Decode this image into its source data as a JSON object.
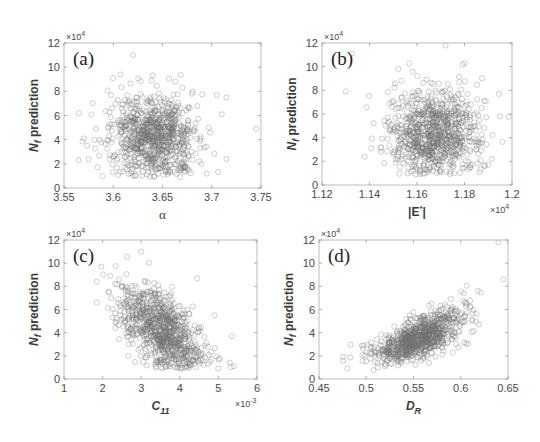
{
  "figure": {
    "panels": [
      "a",
      "b",
      "c",
      "d"
    ]
  },
  "chart_data": [
    {
      "id": "a",
      "type": "scatter",
      "panel_label": "(a)",
      "title": "",
      "xlabel": "α",
      "ylabel": "N_f prediction",
      "ylabel_main": "N",
      "ylabel_sub": "f",
      "ylabel_rest": " prediction",
      "y_multiplier": "×10",
      "y_multiplier_exp": "4",
      "x_multiplier": "",
      "xlim": [
        3.55,
        3.75
      ],
      "ylim": [
        0,
        12
      ],
      "xticks": [
        "3.55",
        "3.6",
        "3.65",
        "3.7",
        "3.75"
      ],
      "yticks": [
        "0",
        "2",
        "4",
        "6",
        "8",
        "10",
        "12"
      ],
      "grid": false,
      "marker": "open-circle",
      "description": "Roughly 1000 points clustered around α≈3.64, N_f≈4×10^4, no clear trend",
      "frame": {
        "left": 64,
        "right": 261,
        "top": 43,
        "bottom": 188
      },
      "points_summary": {
        "x_center": 3.642,
        "x_sd": 0.022,
        "y_center": 4.3,
        "y_sd": 1.7,
        "n": 900,
        "corr": -0.05
      },
      "outliers": [
        [
          3.565,
          6.2
        ],
        [
          3.565,
          2.3
        ],
        [
          3.57,
          4.1
        ],
        [
          3.575,
          2.4
        ],
        [
          3.62,
          11.0
        ],
        [
          3.745,
          4.9
        ],
        [
          3.715,
          2.4
        ],
        [
          3.705,
          7.7
        ],
        [
          3.715,
          7.5
        ]
      ]
    },
    {
      "id": "b",
      "type": "scatter",
      "panel_label": "(b)",
      "title": "",
      "xlabel": "|E*|",
      "ylabel": "N_f prediction",
      "ylabel_main": "N",
      "ylabel_sub": "f",
      "ylabel_rest": " prediction",
      "y_multiplier": "×10",
      "y_multiplier_exp": "4",
      "x_multiplier": "×10",
      "x_multiplier_exp": "4",
      "xlim": [
        1.12,
        1.2
      ],
      "ylim": [
        0,
        12
      ],
      "xticks": [
        "1.12",
        "1.14",
        "1.16",
        "1.18",
        "1.2"
      ],
      "yticks": [
        "0",
        "2",
        "4",
        "6",
        "8",
        "10",
        "12"
      ],
      "grid": false,
      "marker": "open-circle",
      "description": "Roughly 1000 points clustered around |E*|≈1.167×10^4, N_f≈4×10^4, no clear trend",
      "frame": {
        "left": 322,
        "right": 512,
        "top": 43,
        "bottom": 185
      },
      "points_summary": {
        "x_center": 1.1675,
        "x_sd": 0.0095,
        "y_center": 4.3,
        "y_sd": 1.8,
        "n": 900,
        "corr": 0.0
      },
      "outliers": [
        [
          1.13,
          7.9
        ],
        [
          1.195,
          5.8
        ],
        [
          1.138,
          2.4
        ],
        [
          1.19,
          1.7
        ],
        [
          1.172,
          11.8
        ],
        [
          1.18,
          10.3
        ]
      ]
    },
    {
      "id": "c",
      "type": "scatter",
      "panel_label": "(c)",
      "title": "",
      "xlabel": "C_11",
      "xlabel_main": "C",
      "xlabel_sub": "11",
      "ylabel": "N_f prediction",
      "ylabel_main": "N",
      "ylabel_sub": "f",
      "ylabel_rest": " prediction",
      "y_multiplier": "×10",
      "y_multiplier_exp": "4",
      "x_multiplier": "×10",
      "x_multiplier_exp": "-3",
      "xlim": [
        1,
        6
      ],
      "ylim": [
        0,
        12
      ],
      "xticks": [
        "1",
        "2",
        "3",
        "4",
        "5",
        "6"
      ],
      "yticks": [
        "0",
        "2",
        "4",
        "6",
        "8",
        "10",
        "12"
      ],
      "grid": false,
      "marker": "open-circle",
      "description": "Negative correlation: N_f decreases as C_11 increases (x from ~2 to ~5.4 ×10^-3)",
      "frame": {
        "left": 64,
        "right": 257,
        "top": 240,
        "bottom": 379
      },
      "points_summary": {
        "x_center": 3.5,
        "x_sd": 0.55,
        "y_center": 4.3,
        "y_sd": 1.8,
        "n": 900,
        "corr": -0.55
      },
      "outliers": [
        [
          1.85,
          8.4
        ],
        [
          1.85,
          6.6
        ],
        [
          3.0,
          11.0
        ],
        [
          5.4,
          1.1
        ],
        [
          5.35,
          3.7
        ],
        [
          4.9,
          5.5
        ],
        [
          4.45,
          8.7
        ]
      ]
    },
    {
      "id": "d",
      "type": "scatter",
      "panel_label": "(d)",
      "title": "",
      "xlabel": "D_R",
      "xlabel_main": "D",
      "xlabel_sub": "R",
      "ylabel": "N_f prediction",
      "ylabel_main": "N",
      "ylabel_sub": "f",
      "ylabel_rest": " prediction",
      "y_multiplier": "×10",
      "y_multiplier_exp": "4",
      "x_multiplier": "",
      "xlim": [
        0.45,
        0.65
      ],
      "ylim": [
        0,
        12
      ],
      "xticks": [
        "0.45",
        "0.5",
        "0.55",
        "0.6",
        "0.65"
      ],
      "yticks": [
        "0",
        "2",
        "4",
        "6",
        "8",
        "10",
        "12"
      ],
      "grid": false,
      "marker": "open-circle",
      "description": "Strong positive, slightly convex relationship: N_f rises from ~1.5×10^4 at D_R≈0.48 to ~10×10^4 at D_R≈0.63",
      "frame": {
        "left": 319,
        "right": 508,
        "top": 240,
        "bottom": 379
      },
      "points_summary": {
        "x_center": 0.555,
        "x_sd": 0.025,
        "n": 900,
        "relation": "y ≈ 2 + 118*(x-0.48)^2 + 14*(x-0.48)"
      },
      "outliers": [
        [
          0.64,
          11.8
        ],
        [
          0.645,
          8.6
        ],
        [
          0.52,
          1.1
        ],
        [
          0.48,
          0.9
        ]
      ]
    }
  ]
}
